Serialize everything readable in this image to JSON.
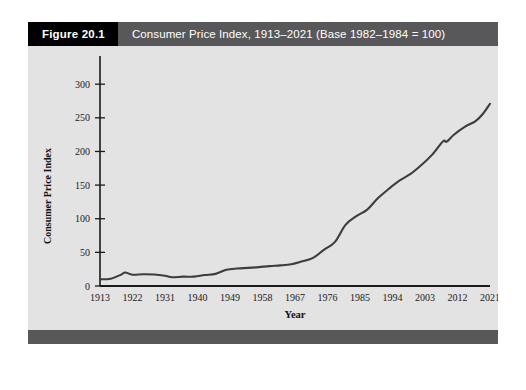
{
  "figure": {
    "tag_label": "Figure 20.1",
    "title": "Consumer Price Index, 1913–2021 (Base 1982–1984 = 100)",
    "colors": {
      "tag_background": "#000000",
      "header_background": "#58585a",
      "panel_background": "#e3e3e3",
      "line_color": "#3d3d3d",
      "axis_color": "#1a1a1a",
      "footer_bar": "#58585a"
    }
  },
  "chart_data": {
    "type": "line",
    "title": "Consumer Price Index, 1913–2021 (Base 1982–1984 = 100)",
    "xlabel": "Year",
    "ylabel": "Consumer Price Index",
    "xlim": [
      1913,
      2021
    ],
    "ylim": [
      0,
      330
    ],
    "grid": false,
    "legend": null,
    "xticks": [
      1913,
      1922,
      1931,
      1940,
      1949,
      1958,
      1967,
      1976,
      1985,
      1994,
      2003,
      2012,
      2021
    ],
    "xtick_labels": [
      "1913",
      "1922",
      "1931",
      "1940",
      "1949",
      "1958",
      "1967",
      "1976",
      "1985",
      "1994",
      "2003",
      "2012",
      "2021"
    ],
    "yticks": [
      0,
      50,
      100,
      150,
      200,
      250,
      300
    ],
    "ytick_labels": [
      "0",
      "50",
      "100",
      "150",
      "200",
      "250",
      "300"
    ],
    "series": [
      {
        "name": "Consumer Price Index",
        "x": [
          1913,
          1916,
          1919,
          1920,
          1922,
          1925,
          1928,
          1931,
          1933,
          1936,
          1939,
          1942,
          1945,
          1948,
          1951,
          1954,
          1957,
          1960,
          1963,
          1966,
          1969,
          1972,
          1975,
          1978,
          1981,
          1984,
          1987,
          1990,
          1993,
          1996,
          1999,
          2002,
          2005,
          2008,
          2009,
          2011,
          2014,
          2017,
          2019,
          2021
        ],
        "y": [
          9.9,
          10.9,
          17.3,
          20.0,
          16.8,
          17.5,
          17.1,
          15.2,
          13.0,
          13.9,
          13.9,
          16.3,
          18.0,
          24.1,
          26.0,
          26.9,
          28.1,
          29.6,
          30.6,
          32.4,
          36.7,
          41.8,
          53.8,
          65.2,
          90.9,
          103.9,
          113.6,
          130.7,
          144.5,
          156.9,
          166.6,
          179.9,
          195.3,
          215.3,
          214.5,
          224.9,
          236.7,
          245.1,
          255.7,
          270.9
        ]
      }
    ]
  }
}
